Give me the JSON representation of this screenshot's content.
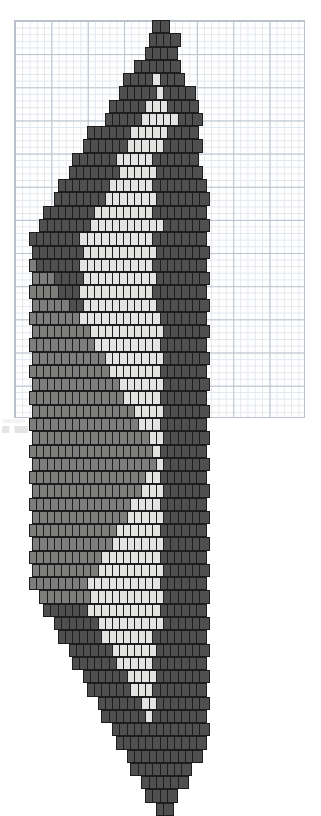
{
  "document": {
    "title": "Brick stitch bead pattern chart",
    "description": "Graph-paper chart of a diamond / leaf shaped motif rendered in offset brick-stitch beads using four shades of grey"
  },
  "grid": {
    "name": "graph-paper",
    "left": 14,
    "top": 20,
    "width": 291,
    "height": 398,
    "minor_cell_width": 7.275,
    "minor_cell_height": 6.633,
    "major_every": 5,
    "minor_line_color": "#e2e7ec",
    "major_line_color": "#b9c2cc",
    "columns": 40,
    "rows": 60
  },
  "palette": {
    "outline": "#1d1d1d",
    "shades": [
      {
        "key": "x",
        "label": "empty",
        "hex": "#ffffff"
      },
      {
        "key": "1",
        "label": "light",
        "hex": "#e3e3e1"
      },
      {
        "key": "2",
        "label": "medium-light",
        "hex": "#a9a9a7"
      },
      {
        "key": "3",
        "label": "medium-dark",
        "hex": "#7d7d7b"
      },
      {
        "key": "4",
        "label": "dark",
        "hex": "#4f4f4f"
      }
    ]
  },
  "chart_data": {
    "type": "heatmap",
    "xlabel": "",
    "ylabel": "",
    "legend": [
      "empty",
      "light",
      "medium-light",
      "medium-dark",
      "dark"
    ],
    "bead": {
      "width": 10.9,
      "height": 13.3,
      "column_step": 7.275,
      "row_step": 13.266,
      "odd_row_offset": 3.6
    },
    "origin": {
      "x": 14,
      "y": 20
    },
    "note": "Each string is one brick-stitch row; characters map to palette.shades keys; '.' = no bead. Odd rows are offset half a bead to the right.",
    "rows": [
      "...................44...................",
      "..................4444..................",
      "..................4444..................",
      "................444444..................",
      "...............44441444.................",
      "..............4444414444................",
      ".............444441114444...............",
      "............4444411111444...............",
      "..........444444111114444...............",
      ".........4444441111144444...............",
      "........44444411111444444...............",
      ".......444444411111444444...............",
      "......44444441111114444444..............",
      ".....444444411111114444444..............",
      "....4444444111111114444444..............",
      "...44444441111111111444444..............",
      "..444444411111111114444444..............",
      "..444444411111111114444444..............",
      "..344444411111111114444444..............",
      "..333444411111111114444444..............",
      "..333344411111111114444444..............",
      "..333334411111111114444444..............",
      "..333333311111111111444444..............",
      "..333333331111111111444444..............",
      "..333333333111111111444444..............",
      "..333333333311111111444444..............",
      "..333333333331111111444444..............",
      "..333333333333111111444444..............",
      "..333333333333311111444444..............",
      "..333333333333331111444444..............",
      "..333333333333333111444444..............",
      "..333333333333333311444444..............",
      "..333333333333333331444444..............",
      "..333333333333333331444444..............",
      "..333333333333333311444444..............",
      "..333333333333333111444444..............",
      "..333333333333331111444444..............",
      "..333333333333311111444444..............",
      "..333333333333111111444444..............",
      "..333333333331111111444444..............",
      "..333333333311111111444444..............",
      "..333333333111111111444444..............",
      "..333333331111111111444444..............",
      "...33333331111111111444444..............",
      "....4444441111111111444444..............",
      ".....444444111111111444444..............",
      "......44444411111114444444..............",
      ".......4444441111114444444..............",
      "........444444111114444444..............",
      ".........44444411114444444..............",
      "..........4444441114444444..............",
      "...........444444114444444..............",
      "............44444414444444..............",
      ".............4444444444444..............",
      "..............444444444444..............",
      "...............4444444444...............",
      "................44444444................",
      ".................444444.................",
      "..................4444..................",
      "...................44..................."
    ]
  },
  "beads": {
    "total_columns": 40,
    "total_rows": 60,
    "shape": "vertical rounded rectangle",
    "stitch": "brick / peyote (offset rows)"
  },
  "artifacts": {
    "bottom_left_smudge": "faint scanner mark"
  }
}
